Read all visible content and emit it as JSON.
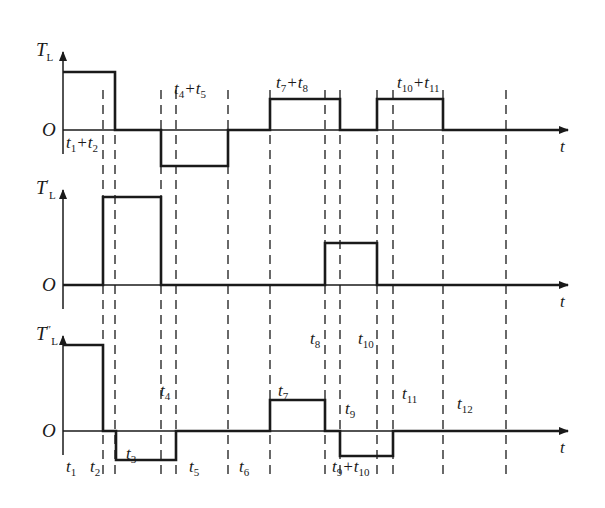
{
  "colors": {
    "line": "#1a1a1a",
    "dash": "#2a2a2a",
    "background": "#ffffff"
  },
  "geometry": {
    "y_axis_x": 63,
    "axis_end_x": 568,
    "dashed_x": [
      103,
      115,
      161,
      176,
      228,
      270,
      325,
      340,
      377,
      393,
      443,
      506
    ],
    "dash_top": 90,
    "dash_bottom": 478
  },
  "panels": [
    {
      "id": "TL",
      "axis_label": "T",
      "axis_sub": "L",
      "axis_prime": "",
      "origin": "O",
      "time_label": "t",
      "zero_y": 130,
      "axis_top_y": 52,
      "waveform": [
        [
          63,
          72
        ],
        [
          115,
          72
        ],
        [
          115,
          130
        ],
        [
          161,
          130
        ],
        [
          161,
          166
        ],
        [
          228,
          166
        ],
        [
          228,
          130
        ],
        [
          270,
          130
        ],
        [
          270,
          99
        ],
        [
          340,
          99
        ],
        [
          340,
          130
        ],
        [
          377,
          130
        ],
        [
          377,
          99
        ],
        [
          443,
          99
        ],
        [
          443,
          130
        ],
        [
          568,
          130
        ]
      ]
    },
    {
      "id": "TL_prime",
      "axis_label": "T",
      "axis_sub": "L",
      "axis_prime": "′",
      "origin": "O",
      "time_label": "t",
      "zero_y": 285,
      "axis_top_y": 190,
      "waveform": [
        [
          63,
          285
        ],
        [
          103,
          285
        ],
        [
          103,
          197
        ],
        [
          161,
          197
        ],
        [
          161,
          285
        ],
        [
          325,
          285
        ],
        [
          325,
          243
        ],
        [
          377,
          243
        ],
        [
          377,
          285
        ],
        [
          568,
          285
        ]
      ]
    },
    {
      "id": "TL_double_prime",
      "axis_label": "T",
      "axis_sub": "L",
      "axis_prime": "″",
      "origin": "O",
      "time_label": "t",
      "zero_y": 431,
      "axis_top_y": 336,
      "waveform": [
        [
          63,
          345
        ],
        [
          103,
          345
        ],
        [
          103,
          431
        ],
        [
          116,
          431
        ],
        [
          116,
          460
        ],
        [
          176,
          460
        ],
        [
          176,
          431
        ],
        [
          270,
          431
        ],
        [
          270,
          400
        ],
        [
          325,
          400
        ],
        [
          325,
          431
        ],
        [
          340,
          431
        ],
        [
          340,
          456
        ],
        [
          393,
          456
        ],
        [
          393,
          431
        ],
        [
          568,
          431
        ]
      ]
    }
  ],
  "labels": {
    "panel1": [
      {
        "text": "t",
        "sub": "1",
        "tail": "+t",
        "sub2": "2",
        "x": 66,
        "y": 134
      },
      {
        "text": "t",
        "sub": "4",
        "tail": "+t",
        "sub2": "5",
        "x": 174,
        "y": 80
      },
      {
        "text": "t",
        "sub": "7",
        "tail": "+t",
        "sub2": "8",
        "x": 276,
        "y": 74
      },
      {
        "text": "t",
        "sub": "10",
        "tail": "+t",
        "sub2": "11",
        "x": 397,
        "y": 74
      }
    ],
    "panel3": [
      {
        "text": "t",
        "sub": "1",
        "x": 66,
        "y": 458
      },
      {
        "text": "t",
        "sub": "2",
        "x": 90,
        "y": 458
      },
      {
        "text": "t",
        "sub": "3",
        "x": 126,
        "y": 445
      },
      {
        "text": "t",
        "sub": "4",
        "x": 160,
        "y": 382
      },
      {
        "text": "t",
        "sub": "5",
        "x": 189,
        "y": 458
      },
      {
        "text": "t",
        "sub": "6",
        "x": 239,
        "y": 458
      },
      {
        "text": "t",
        "sub": "7",
        "x": 278,
        "y": 382
      },
      {
        "text": "t",
        "sub": "8",
        "x": 310,
        "y": 330
      },
      {
        "text": "t",
        "sub": "9",
        "x": 345,
        "y": 400
      },
      {
        "text": "t",
        "sub": "10",
        "x": 358,
        "y": 330
      },
      {
        "text": "t",
        "sub": "11",
        "x": 402,
        "y": 385
      },
      {
        "text": "t",
        "sub": "12",
        "x": 457,
        "y": 395
      },
      {
        "text": "t",
        "sub": "9",
        "tail": "+t",
        "sub2": "10",
        "x": 332,
        "y": 458
      }
    ]
  }
}
